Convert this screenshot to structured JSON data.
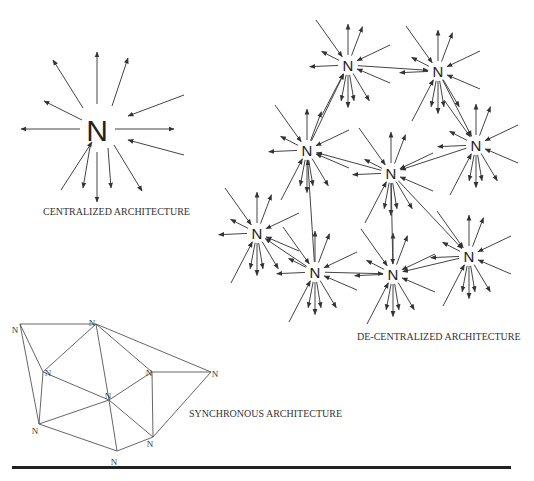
{
  "labels": {
    "centralized": "CENTRALIZED ARCHITECTURE",
    "decentralized": "DE-CENTRALIZED ARCHITECTURE",
    "synchronous": "SYNCHRONOUS ARCHITECTURE"
  },
  "node_letter": "N",
  "colors": {
    "line": "#444444",
    "text": "#222222",
    "rule": "#222222"
  },
  "centralized": {
    "node": {
      "x": 97,
      "y": 130,
      "size": 30
    },
    "arrows": [
      {
        "from": [
          97,
          104
        ],
        "to": [
          97,
          52
        ]
      },
      {
        "from": [
          112,
          106
        ],
        "to": [
          128,
          58
        ]
      },
      {
        "from": [
          83,
          108
        ],
        "to": [
          53,
          60
        ],
        "dir": "in"
      },
      {
        "from": [
          184,
          95
        ],
        "to": [
          128,
          116
        ],
        "dir": "in"
      },
      {
        "from": [
          82,
          120
        ],
        "to": [
          44,
          101
        ]
      },
      {
        "from": [
          80,
          129
        ],
        "to": [
          21,
          129
        ]
      },
      {
        "from": [
          115,
          129
        ],
        "to": [
          174,
          129
        ]
      },
      {
        "from": [
          184,
          155
        ],
        "to": [
          128,
          140
        ],
        "dir": "in"
      },
      {
        "from": [
          61,
          190
        ],
        "to": [
          92,
          142
        ],
        "dir": "in"
      },
      {
        "from": [
          90,
          147
        ],
        "to": [
          83,
          188
        ]
      },
      {
        "from": [
          97,
          152
        ],
        "to": [
          97,
          202
        ]
      },
      {
        "from": [
          108,
          148
        ],
        "to": [
          111,
          188
        ]
      },
      {
        "from": [
          114,
          145
        ],
        "to": [
          142,
          191
        ]
      }
    ]
  },
  "decentralized": {
    "nodes": [
      {
        "id": "d1",
        "x": 348,
        "y": 65
      },
      {
        "id": "d2",
        "x": 438,
        "y": 71
      },
      {
        "id": "d3",
        "x": 476,
        "y": 145
      },
      {
        "id": "d4",
        "x": 307,
        "y": 150
      },
      {
        "id": "d5",
        "x": 391,
        "y": 173
      },
      {
        "id": "d6",
        "x": 257,
        "y": 233
      },
      {
        "id": "d7",
        "x": 315,
        "y": 272
      },
      {
        "id": "d8",
        "x": 393,
        "y": 274
      },
      {
        "id": "d9",
        "x": 469,
        "y": 256
      }
    ],
    "links": [
      {
        "from": "d1",
        "to": "d2"
      },
      {
        "from": "d4",
        "to": "d1",
        "dir": "in_from"
      },
      {
        "from": "d2",
        "to": "d3"
      },
      {
        "from": "d3",
        "to": "d5"
      },
      {
        "from": "d5",
        "to": "d4"
      },
      {
        "from": "d7",
        "to": "d4"
      },
      {
        "from": "d7",
        "to": "d6"
      },
      {
        "from": "d7",
        "to": "d8"
      },
      {
        "from": "d5",
        "to": "d9"
      },
      {
        "from": "d9",
        "to": "d8"
      },
      {
        "from": "d5",
        "to": "d8"
      }
    ],
    "spokes": [
      [
        0,
        -48
      ],
      [
        17,
        -45
      ],
      [
        -32,
        -45,
        "in"
      ],
      [
        42,
        -20,
        "in"
      ],
      [
        -31,
        -16
      ],
      [
        -45,
        2
      ],
      [
        42,
        18,
        "in"
      ],
      [
        -26,
        50,
        "in"
      ],
      [
        -8,
        42
      ],
      [
        0,
        50
      ],
      [
        7,
        42
      ],
      [
        25,
        42
      ]
    ]
  },
  "synchronous": {
    "nodes": [
      {
        "id": "a",
        "x": 20,
        "y": 324,
        "lx": 15,
        "ly": 330
      },
      {
        "id": "b",
        "x": 96,
        "y": 324,
        "lx": 92,
        "ly": 323
      },
      {
        "id": "c",
        "x": 43,
        "y": 372,
        "lx": 48,
        "ly": 373
      },
      {
        "id": "d",
        "x": 109,
        "y": 400,
        "lx": 108,
        "ly": 396
      },
      {
        "id": "e",
        "x": 39,
        "y": 424,
        "lx": 35,
        "ly": 431
      },
      {
        "id": "f",
        "x": 117,
        "y": 451,
        "lx": 114,
        "ly": 462
      },
      {
        "id": "g",
        "x": 152,
        "y": 372,
        "lx": 149,
        "ly": 373
      },
      {
        "id": "h",
        "x": 153,
        "y": 437,
        "lx": 150,
        "ly": 444
      },
      {
        "id": "i",
        "x": 211,
        "y": 372,
        "lx": 215,
        "ly": 374
      }
    ],
    "edges": [
      [
        "a",
        "b"
      ],
      [
        "a",
        "c"
      ],
      [
        "a",
        "e"
      ],
      [
        "b",
        "c"
      ],
      [
        "b",
        "d"
      ],
      [
        "b",
        "g"
      ],
      [
        "b",
        "i"
      ],
      [
        "c",
        "d"
      ],
      [
        "c",
        "e"
      ],
      [
        "d",
        "e"
      ],
      [
        "d",
        "g"
      ],
      [
        "d",
        "h"
      ],
      [
        "d",
        "f"
      ],
      [
        "e",
        "f"
      ],
      [
        "f",
        "h"
      ],
      [
        "g",
        "h"
      ],
      [
        "g",
        "i"
      ],
      [
        "h",
        "i"
      ]
    ]
  }
}
